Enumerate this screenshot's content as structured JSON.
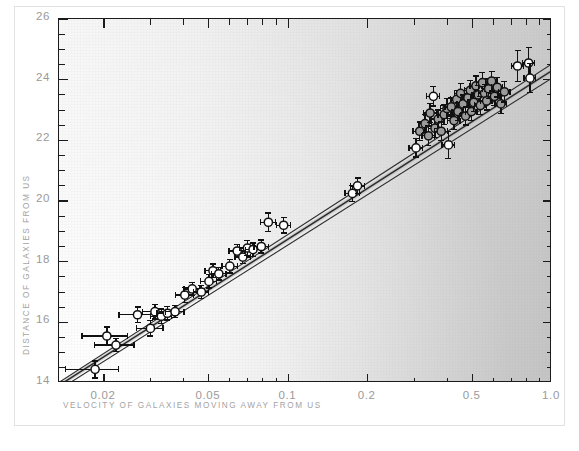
{
  "chart_data": {
    "type": "scatter",
    "title": "",
    "xlabel": "VELOCITY OF GALAXIES MOVING AWAY FROM US",
    "ylabel": "DISTANCE OF GALAXIES FROM US",
    "xscale": "log",
    "yscale": "linear",
    "xlim": [
      0.0135,
      1.0
    ],
    "ylim": [
      14,
      26
    ],
    "xticks": [
      0.02,
      0.05,
      0.1,
      0.2,
      0.5,
      1.0
    ],
    "xtick_labels": [
      "0.02",
      "0.05",
      "0.1",
      "0.2",
      "0.5",
      "1.0"
    ],
    "yticks": [
      14,
      16,
      18,
      20,
      22,
      24,
      26
    ],
    "ytick_labels": [
      "14",
      "16",
      "18",
      "20",
      "22",
      "24",
      "26"
    ],
    "y_minor_step": 0.5,
    "grid": false,
    "legend": "none",
    "marker": "open-circle-with-xy-errorbars",
    "series": [
      {
        "name": "galaxies",
        "points": [
          {
            "x": 0.0185,
            "y": 14.45,
            "xerr": 0.0042,
            "yerr": 0.28,
            "shade": "open"
          },
          {
            "x": 0.0205,
            "y": 15.55,
            "xerr": 0.004,
            "yerr": 0.3,
            "shade": "open"
          },
          {
            "x": 0.0222,
            "y": 15.25,
            "xerr": 0.0038,
            "yerr": 0.22,
            "shade": "open"
          },
          {
            "x": 0.0268,
            "y": 16.25,
            "xerr": 0.004,
            "yerr": 0.26,
            "shade": "open"
          },
          {
            "x": 0.03,
            "y": 15.8,
            "xerr": 0.0035,
            "yerr": 0.25,
            "shade": "open"
          },
          {
            "x": 0.0312,
            "y": 16.35,
            "xerr": 0.0032,
            "yerr": 0.24,
            "shade": "open"
          },
          {
            "x": 0.033,
            "y": 16.2,
            "xerr": 0.003,
            "yerr": 0.24,
            "shade": "open"
          },
          {
            "x": 0.0348,
            "y": 16.3,
            "xerr": 0.003,
            "yerr": 0.22,
            "shade": "open"
          },
          {
            "x": 0.0372,
            "y": 16.35,
            "xerr": 0.003,
            "yerr": 0.2,
            "shade": "open"
          },
          {
            "x": 0.0405,
            "y": 16.9,
            "xerr": 0.0032,
            "yerr": 0.24,
            "shade": "open"
          },
          {
            "x": 0.0432,
            "y": 17.1,
            "xerr": 0.003,
            "yerr": 0.22,
            "shade": "open"
          },
          {
            "x": 0.0468,
            "y": 17.0,
            "xerr": 0.003,
            "yerr": 0.22,
            "shade": "open"
          },
          {
            "x": 0.05,
            "y": 17.35,
            "xerr": 0.0035,
            "yerr": 0.22,
            "shade": "open"
          },
          {
            "x": 0.0518,
            "y": 17.7,
            "xerr": 0.0035,
            "yerr": 0.22,
            "shade": "open"
          },
          {
            "x": 0.0545,
            "y": 17.6,
            "xerr": 0.0035,
            "yerr": 0.2,
            "shade": "open"
          },
          {
            "x": 0.06,
            "y": 17.85,
            "xerr": 0.004,
            "yerr": 0.22,
            "shade": "open"
          },
          {
            "x": 0.064,
            "y": 18.35,
            "xerr": 0.0045,
            "yerr": 0.22,
            "shade": "open"
          },
          {
            "x": 0.0672,
            "y": 18.15,
            "xerr": 0.0045,
            "yerr": 0.22,
            "shade": "open"
          },
          {
            "x": 0.07,
            "y": 18.45,
            "xerr": 0.0048,
            "yerr": 0.24,
            "shade": "open"
          },
          {
            "x": 0.0735,
            "y": 18.4,
            "xerr": 0.0048,
            "yerr": 0.22,
            "shade": "open"
          },
          {
            "x": 0.079,
            "y": 18.5,
            "xerr": 0.005,
            "yerr": 0.22,
            "shade": "open"
          },
          {
            "x": 0.084,
            "y": 19.3,
            "xerr": 0.0055,
            "yerr": 0.3,
            "shade": "open"
          },
          {
            "x": 0.096,
            "y": 19.2,
            "xerr": 0.006,
            "yerr": 0.26,
            "shade": "open"
          },
          {
            "x": 0.175,
            "y": 20.25,
            "xerr": 0.011,
            "yerr": 0.26,
            "shade": "open"
          },
          {
            "x": 0.183,
            "y": 20.5,
            "xerr": 0.011,
            "yerr": 0.26,
            "shade": "open"
          },
          {
            "x": 0.305,
            "y": 21.75,
            "xerr": 0.018,
            "yerr": 0.3,
            "shade": "open"
          },
          {
            "x": 0.315,
            "y": 22.3,
            "xerr": 0.018,
            "yerr": 0.3,
            "shade": "shaded"
          },
          {
            "x": 0.33,
            "y": 22.55,
            "xerr": 0.019,
            "yerr": 0.3,
            "shade": "shaded"
          },
          {
            "x": 0.34,
            "y": 22.15,
            "xerr": 0.019,
            "yerr": 0.32,
            "shade": "shaded"
          },
          {
            "x": 0.345,
            "y": 22.9,
            "xerr": 0.019,
            "yerr": 0.32,
            "shade": "shaded"
          },
          {
            "x": 0.355,
            "y": 23.45,
            "xerr": 0.02,
            "yerr": 0.32,
            "shade": "open"
          },
          {
            "x": 0.36,
            "y": 22.4,
            "xerr": 0.02,
            "yerr": 0.3,
            "shade": "shaded"
          },
          {
            "x": 0.37,
            "y": 22.7,
            "xerr": 0.02,
            "yerr": 0.3,
            "shade": "shaded"
          },
          {
            "x": 0.38,
            "y": 22.3,
            "xerr": 0.021,
            "yerr": 0.3,
            "shade": "shaded"
          },
          {
            "x": 0.39,
            "y": 22.85,
            "xerr": 0.021,
            "yerr": 0.32,
            "shade": "shaded"
          },
          {
            "x": 0.4,
            "y": 23.05,
            "xerr": 0.022,
            "yerr": 0.32,
            "shade": "shaded"
          },
          {
            "x": 0.405,
            "y": 21.85,
            "xerr": 0.022,
            "yerr": 0.45,
            "shade": "open"
          },
          {
            "x": 0.415,
            "y": 23.1,
            "xerr": 0.022,
            "yerr": 0.3,
            "shade": "shaded"
          },
          {
            "x": 0.425,
            "y": 22.65,
            "xerr": 0.023,
            "yerr": 0.3,
            "shade": "shaded"
          },
          {
            "x": 0.435,
            "y": 23.35,
            "xerr": 0.023,
            "yerr": 0.3,
            "shade": "shaded"
          },
          {
            "x": 0.44,
            "y": 22.95,
            "xerr": 0.023,
            "yerr": 0.3,
            "shade": "shaded"
          },
          {
            "x": 0.45,
            "y": 23.55,
            "xerr": 0.024,
            "yerr": 0.32,
            "shade": "shaded"
          },
          {
            "x": 0.46,
            "y": 23.2,
            "xerr": 0.024,
            "yerr": 0.3,
            "shade": "shaded"
          },
          {
            "x": 0.47,
            "y": 22.8,
            "xerr": 0.025,
            "yerr": 0.3,
            "shade": "shaded"
          },
          {
            "x": 0.48,
            "y": 23.4,
            "xerr": 0.025,
            "yerr": 0.3,
            "shade": "shaded"
          },
          {
            "x": 0.49,
            "y": 23.65,
            "xerr": 0.025,
            "yerr": 0.32,
            "shade": "shaded"
          },
          {
            "x": 0.495,
            "y": 22.95,
            "xerr": 0.025,
            "yerr": 0.3,
            "shade": "shaded"
          },
          {
            "x": 0.505,
            "y": 23.25,
            "xerr": 0.026,
            "yerr": 0.3,
            "shade": "shaded"
          },
          {
            "x": 0.515,
            "y": 23.8,
            "xerr": 0.026,
            "yerr": 0.32,
            "shade": "shaded"
          },
          {
            "x": 0.525,
            "y": 23.5,
            "xerr": 0.027,
            "yerr": 0.3,
            "shade": "shaded"
          },
          {
            "x": 0.535,
            "y": 23.15,
            "xerr": 0.027,
            "yerr": 0.3,
            "shade": "shaded"
          },
          {
            "x": 0.545,
            "y": 23.9,
            "xerr": 0.027,
            "yerr": 0.34,
            "shade": "shaded"
          },
          {
            "x": 0.555,
            "y": 23.55,
            "xerr": 0.028,
            "yerr": 0.3,
            "shade": "shaded"
          },
          {
            "x": 0.565,
            "y": 23.3,
            "xerr": 0.028,
            "yerr": 0.3,
            "shade": "shaded"
          },
          {
            "x": 0.575,
            "y": 23.7,
            "xerr": 0.029,
            "yerr": 0.32,
            "shade": "shaded"
          },
          {
            "x": 0.59,
            "y": 23.95,
            "xerr": 0.029,
            "yerr": 0.32,
            "shade": "shaded"
          },
          {
            "x": 0.605,
            "y": 23.45,
            "xerr": 0.03,
            "yerr": 0.3,
            "shade": "shaded"
          },
          {
            "x": 0.62,
            "y": 23.75,
            "xerr": 0.03,
            "yerr": 0.32,
            "shade": "shaded"
          },
          {
            "x": 0.64,
            "y": 23.2,
            "xerr": 0.032,
            "yerr": 0.32,
            "shade": "shaded"
          },
          {
            "x": 0.66,
            "y": 23.6,
            "xerr": 0.033,
            "yerr": 0.34,
            "shade": "shaded"
          },
          {
            "x": 0.74,
            "y": 24.45,
            "xerr": 0.038,
            "yerr": 0.52,
            "shade": "open"
          },
          {
            "x": 0.815,
            "y": 24.55,
            "xerr": 0.042,
            "yerr": 0.5,
            "shade": "open"
          },
          {
            "x": 0.825,
            "y": 24.05,
            "xerr": 0.042,
            "yerr": 0.48,
            "shade": "open"
          }
        ]
      }
    ],
    "fit_lines": [
      {
        "name": "fit-1",
        "x1": 0.0135,
        "y1": 13.78,
        "x2": 1.0,
        "y2": 24.05
      },
      {
        "name": "fit-2",
        "x1": 0.0135,
        "y1": 13.92,
        "x2": 1.0,
        "y2": 24.3
      },
      {
        "name": "fit-3",
        "x1": 0.0135,
        "y1": 14.02,
        "x2": 1.0,
        "y2": 24.52
      }
    ]
  },
  "axes": {
    "x": {
      "label": "VELOCITY OF GALAXIES MOVING AWAY FROM US",
      "tick_labels": [
        "0.02",
        "0.05",
        "0.1",
        "0.2",
        "0.5",
        "1.0"
      ]
    },
    "y": {
      "label": "DISTANCE OF GALAXIES FROM US",
      "tick_labels": [
        "26",
        "24",
        "22",
        "20",
        "18",
        "16",
        "14"
      ]
    }
  },
  "colors": {
    "axis": "#1b1b1b",
    "tick_text": "#9a9a9a",
    "axis_title": "#a3a3a3",
    "marker_edge": "#111111",
    "marker_fill_open": "#ffffff",
    "marker_fill_shaded": "#9b9b9b",
    "fit_line": "#2b2b2b",
    "page_background": "#ffffff"
  }
}
